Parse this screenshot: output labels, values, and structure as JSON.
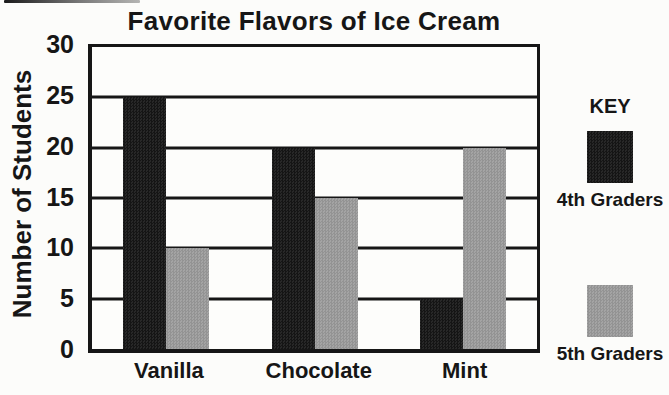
{
  "chart_data": {
    "type": "bar",
    "title": "Favorite Flavors of Ice Cream",
    "xlabel": "",
    "ylabel": "Number of Students",
    "categories": [
      "Vanilla",
      "Chocolate",
      "Mint"
    ],
    "series": [
      {
        "name": "4th Graders",
        "color": "#161616",
        "values": [
          25,
          20,
          5
        ]
      },
      {
        "name": "5th Graders",
        "color": "#9c9c9c",
        "values": [
          10,
          15,
          20
        ]
      }
    ],
    "ylim": [
      0,
      30
    ],
    "yticks": [
      0,
      5,
      10,
      15,
      20,
      25,
      30
    ],
    "grid": true,
    "legend_title": "KEY",
    "legend_position": "right"
  }
}
